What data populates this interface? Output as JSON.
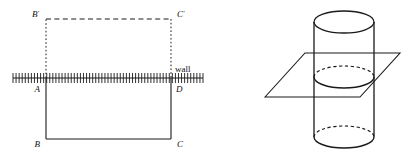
{
  "figure": {
    "background_color": "#ffffff",
    "stroke_color": "#1a1a1a",
    "width": 413,
    "height": 158
  },
  "left_diagram": {
    "name": "rectangle-reflected-across-wall",
    "labels": {
      "b_prime": "B",
      "b_prime_mark": "'",
      "c_prime": "C",
      "c_prime_mark": "'",
      "a": "A",
      "d": "D",
      "b": "B",
      "c": "C",
      "wall": "wall"
    },
    "geometry": {
      "rect_left_x": 46,
      "rect_right_x": 171,
      "top_y": 19,
      "wall_y": 78,
      "bottom_y": 139,
      "hatch_start_x": 13,
      "hatch_end_x": 203,
      "hatch_tick_count": 62,
      "hatch_tick_height": 5
    },
    "line_styles": {
      "upper_rect": "dashed",
      "lower_rect": "solid",
      "wall_line": "solid-hatched"
    }
  },
  "right_diagram": {
    "name": "cylinder-cut-by-plane",
    "geometry": {
      "cylinder_center_x": 344,
      "cylinder_left_x": 314,
      "cylinder_right_x": 374,
      "cylinder_radius_x": 30,
      "cylinder_radius_y": 11,
      "top_ellipse_cy": 22,
      "mid_ellipse_cy": 77,
      "bottom_ellipse_cy": 137,
      "plane_points": "265,97 305,53 400,53 360,97"
    },
    "line_styles": {
      "top_ellipse": "solid",
      "mid_ellipse_back": "dashed",
      "mid_ellipse_front": "solid",
      "bottom_ellipse_back": "dashed",
      "bottom_ellipse_front": "solid",
      "cylinder_sides": "solid",
      "plane": "solid"
    }
  }
}
